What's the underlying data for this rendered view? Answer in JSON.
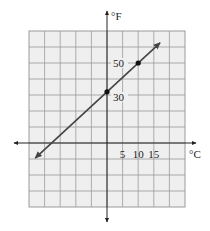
{
  "chart_data": {
    "type": "line",
    "title": "",
    "xlabel": "°C",
    "ylabel": "°F",
    "x_tick_labels": [
      "5",
      "10",
      "15"
    ],
    "y_tick_labels": [
      "30",
      "50"
    ],
    "x_step": 5,
    "y_step": 10,
    "xlim": [
      -30,
      20
    ],
    "ylim": [
      -40,
      70
    ],
    "grid": true,
    "series": [
      {
        "name": "F = 1.8C + 32",
        "x": [
          -23,
          0,
          10,
          17
        ],
        "y": [
          -9.4,
          32,
          50,
          62.6
        ],
        "marked_points": [
          {
            "x": 0,
            "y": 32
          },
          {
            "x": 10,
            "y": 50
          }
        ]
      }
    ]
  },
  "colors": {
    "grid_fill": "#efefef",
    "grid_line": "#9a9a9a",
    "axis": "#222222",
    "line": "#444444"
  }
}
